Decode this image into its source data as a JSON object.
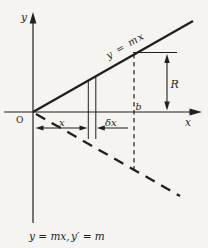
{
  "figure": {
    "background": "#f5f4f1",
    "ink": "#201f1d",
    "labels": {
      "y_axis": "y",
      "x_axis": "x",
      "origin": "O",
      "line_equation": "y = mx",
      "x_interval": "x",
      "delta_x": "δx",
      "b_point": "b",
      "r_measure": "R",
      "caption_part1": "y = mx,",
      "caption_part2": "y′ = m"
    }
  }
}
